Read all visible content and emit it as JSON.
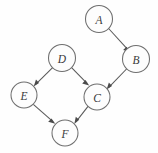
{
  "figure": {
    "type": "directed-acyclic-graph",
    "background_color": "#fefefe",
    "node_stroke_color": "#6f6f6f",
    "node_fill_color": "#fdfdfd",
    "edge_color": "#595959",
    "label_color": "#3a3a3a",
    "nodes": [
      {
        "id": "A",
        "label": "A",
        "cx": 99,
        "cy": 19,
        "r": 13.5
      },
      {
        "id": "B",
        "label": "B",
        "cx": 136,
        "cy": 59,
        "r": 13.5
      },
      {
        "id": "C",
        "label": "C",
        "cx": 97,
        "cy": 97,
        "r": 13.0
      },
      {
        "id": "D",
        "label": "D",
        "cx": 62,
        "cy": 58,
        "r": 13.5
      },
      {
        "id": "E",
        "label": "E",
        "cx": 24,
        "cy": 95,
        "r": 13.0
      },
      {
        "id": "F",
        "label": "F",
        "cx": 65,
        "cy": 133,
        "r": 13.0
      }
    ],
    "edges": [
      {
        "id": "A-B",
        "from": "A",
        "to": "B",
        "directed": true
      },
      {
        "id": "B-C",
        "from": "B",
        "to": "C",
        "directed": true
      },
      {
        "id": "D-E",
        "from": "D",
        "to": "E",
        "directed": true
      },
      {
        "id": "D-C",
        "from": "D",
        "to": "C",
        "directed": true
      },
      {
        "id": "E-F",
        "from": "E",
        "to": "F",
        "directed": true
      },
      {
        "id": "C-F",
        "from": "C",
        "to": "F",
        "directed": true
      }
    ]
  }
}
